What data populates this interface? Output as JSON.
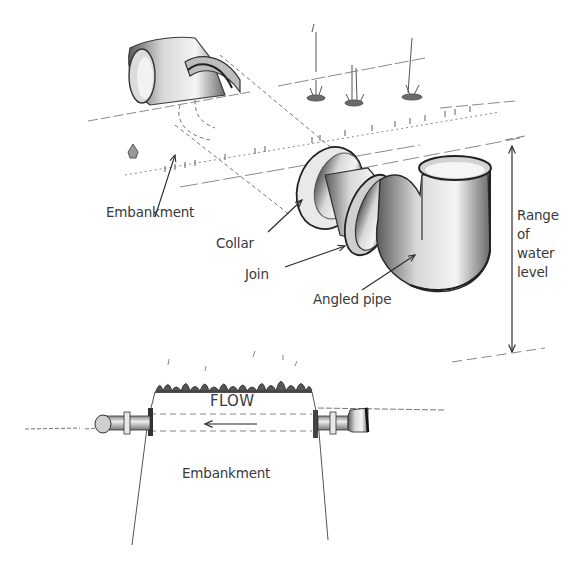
{
  "diagram": {
    "type": "technical-illustration",
    "top_view": {
      "labels": {
        "embankment": "Embankment",
        "collar": "Collar",
        "join": "Join",
        "angled_pipe": "Angled pipe",
        "range_of_water_level": [
          "Range",
          "of",
          "water",
          "level"
        ]
      }
    },
    "cross_section": {
      "labels": {
        "flow": "FLOW",
        "embankment": "Embankment"
      },
      "flow_direction": "left"
    },
    "colors": {
      "ink": "#3a3a3a",
      "pipe_shade": "#8a8a8a",
      "grass": "#4a4a4a",
      "background": "#ffffff"
    }
  }
}
